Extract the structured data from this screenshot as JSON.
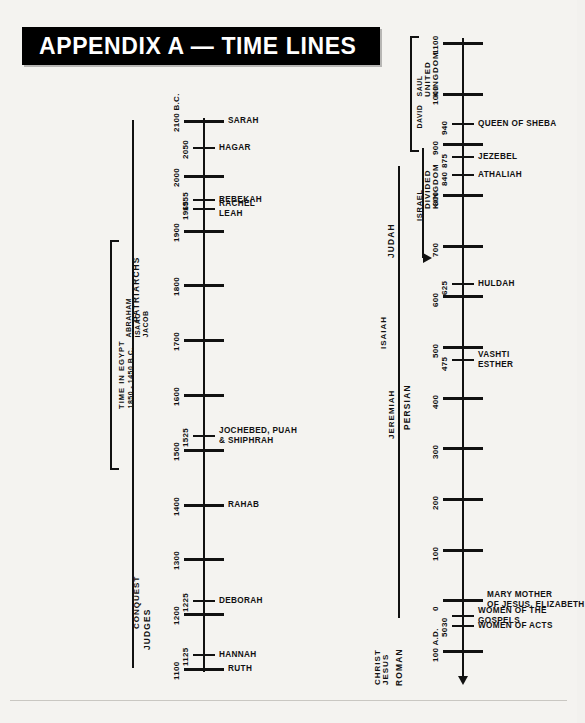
{
  "header": {
    "title": "APPENDIX A — TIME LINES"
  },
  "left_timeline": {
    "name": "old-testament-timeline",
    "range_top_label": "2100 B.C.",
    "range_bottom_label": "1100",
    "era_captions": [
      {
        "label": "PATRIARCHS",
        "sub": "ABRAHAM ISAAC JACOB"
      },
      {
        "label": "TIME IN EGYPT",
        "sub": "1850 - 1450 B.C."
      },
      {
        "label": "CONQUEST",
        "sub": ""
      },
      {
        "label": "JUDGES",
        "sub": ""
      }
    ],
    "ticks": [
      {
        "year": "2100 B.C.",
        "major": true,
        "events": [
          "SARAH"
        ]
      },
      {
        "year": "2050",
        "major": false,
        "events": [
          "HAGAR"
        ]
      },
      {
        "year": "2000",
        "major": true,
        "events": []
      },
      {
        "year": "1955",
        "major": false,
        "events": [
          "REBEKAH"
        ]
      },
      {
        "year": "1965",
        "major": false,
        "events": [
          "RACHEL",
          "LEAH"
        ]
      },
      {
        "year": "1900",
        "major": true,
        "events": []
      },
      {
        "year": "1800",
        "major": true,
        "events": []
      },
      {
        "year": "1700",
        "major": true,
        "events": []
      },
      {
        "year": "1600",
        "major": true,
        "events": []
      },
      {
        "year": "1525",
        "major": false,
        "events": [
          "JOCHEBED, PUAH",
          "& SHIPHRAH"
        ]
      },
      {
        "year": "1500",
        "major": true,
        "events": []
      },
      {
        "year": "1400",
        "major": true,
        "events": [
          "RAHAB"
        ]
      },
      {
        "year": "1300",
        "major": true,
        "events": []
      },
      {
        "year": "1225",
        "major": false,
        "events": [
          "DEBORAH"
        ]
      },
      {
        "year": "1200",
        "major": true,
        "events": []
      },
      {
        "year": "1125",
        "major": false,
        "events": [
          "HANNAH"
        ]
      },
      {
        "year": "1100",
        "major": true,
        "events": [
          "RUTH"
        ]
      }
    ]
  },
  "right_timeline": {
    "name": "kingdom-to-new-testament-timeline",
    "range_top_label": "1100",
    "range_bottom_label": "100 A.D.",
    "era_captions": [
      {
        "label": "UNITED KINGDOM",
        "sub": "SAUL DAVID"
      },
      {
        "label": "DIVIDED KINGDOM",
        "sub": "ISRAEL"
      },
      {
        "label": "JUDAH",
        "sub": ""
      },
      {
        "label": "ISAIAH",
        "sub": ""
      },
      {
        "label": "JEREMIAH",
        "sub": ""
      },
      {
        "label": "PERSIAN",
        "sub": ""
      },
      {
        "label": "ROMAN",
        "sub": ""
      },
      {
        "label": "JESUS CHRIST",
        "sub": ""
      }
    ],
    "ticks": [
      {
        "year": "1100",
        "major": true,
        "events": []
      },
      {
        "year": "1000",
        "major": true,
        "events": []
      },
      {
        "year": "940",
        "major": false,
        "events": [
          "QUEEN OF SHEBA"
        ]
      },
      {
        "year": "900",
        "major": true,
        "events": []
      },
      {
        "year": "875",
        "major": false,
        "events": [
          "JEZEBEL"
        ]
      },
      {
        "year": "840",
        "major": false,
        "events": [
          "ATHALIAH"
        ]
      },
      {
        "year": "800",
        "major": true,
        "events": []
      },
      {
        "year": "700",
        "major": true,
        "events": []
      },
      {
        "year": "625",
        "major": false,
        "events": [
          "HULDAH"
        ]
      },
      {
        "year": "600",
        "major": true,
        "events": []
      },
      {
        "year": "500",
        "major": true,
        "events": []
      },
      {
        "year": "475",
        "major": false,
        "events": [
          "VASHTI",
          "ESTHER"
        ]
      },
      {
        "year": "400",
        "major": true,
        "events": []
      },
      {
        "year": "300",
        "major": true,
        "events": []
      },
      {
        "year": "200",
        "major": true,
        "events": []
      },
      {
        "year": "100",
        "major": true,
        "events": []
      },
      {
        "year": "0",
        "major": true,
        "events": [
          "MARY MOTHER",
          "OF JESUS, ELIZABETH"
        ]
      },
      {
        "year": "30",
        "major": false,
        "events": [
          "WOMEN OF THE",
          "GOSPELS"
        ]
      },
      {
        "year": "50",
        "major": false,
        "events": [
          "WOMEN OF ACTS"
        ]
      },
      {
        "year": "100 A.D.",
        "major": true,
        "events": []
      }
    ]
  },
  "chart_data": {
    "type": "table",
    "title": "APPENDIX A — TIME LINES",
    "xlabel": "",
    "ylabel": "Years (B.C. → A.D.)",
    "series": [
      {
        "name": "Old Testament Era (left column)",
        "axis_range": [
          "2100 B.C.",
          "1100 B.C."
        ],
        "values": [
          {
            "year": "2100 B.C.",
            "label": "SARAH"
          },
          {
            "year": "2050",
            "label": "HAGAR"
          },
          {
            "year": "2000",
            "label": ""
          },
          {
            "year": "1955",
            "label": "REBEKAH"
          },
          {
            "year": "1965",
            "label": "RACHEL / LEAH"
          },
          {
            "year": "1900",
            "label": ""
          },
          {
            "year": "1800",
            "label": ""
          },
          {
            "year": "1700",
            "label": ""
          },
          {
            "year": "1600",
            "label": ""
          },
          {
            "year": "1525",
            "label": "JOCHEBED, PUAH & SHIPHRAH"
          },
          {
            "year": "1500",
            "label": ""
          },
          {
            "year": "1400",
            "label": "RAHAB"
          },
          {
            "year": "1300",
            "label": ""
          },
          {
            "year": "1225",
            "label": "DEBORAH"
          },
          {
            "year": "1200",
            "label": ""
          },
          {
            "year": "1125",
            "label": "HANNAH"
          },
          {
            "year": "1100",
            "label": "RUTH"
          }
        ],
        "eras": [
          "PATRIARCHS (ABRAHAM ISAAC JACOB)",
          "TIME IN EGYPT 1850-1450 B.C.",
          "CONQUEST",
          "JUDGES"
        ]
      },
      {
        "name": "Kingdom to New Testament Era (right column)",
        "axis_range": [
          "1100 B.C.",
          "100 A.D."
        ],
        "values": [
          {
            "year": "1100",
            "label": ""
          },
          {
            "year": "1000",
            "label": ""
          },
          {
            "year": "940",
            "label": "QUEEN OF SHEBA"
          },
          {
            "year": "900",
            "label": ""
          },
          {
            "year": "875",
            "label": "JEZEBEL"
          },
          {
            "year": "840",
            "label": "ATHALIAH"
          },
          {
            "year": "800",
            "label": ""
          },
          {
            "year": "700",
            "label": ""
          },
          {
            "year": "625",
            "label": "HULDAH"
          },
          {
            "year": "600",
            "label": ""
          },
          {
            "year": "500",
            "label": ""
          },
          {
            "year": "475",
            "label": "VASHTI / ESTHER"
          },
          {
            "year": "400",
            "label": ""
          },
          {
            "year": "300",
            "label": ""
          },
          {
            "year": "200",
            "label": ""
          },
          {
            "year": "100",
            "label": ""
          },
          {
            "year": "0",
            "label": "MARY MOTHER OF JESUS, ELIZABETH"
          },
          {
            "year": "30",
            "label": "WOMEN OF THE GOSPELS"
          },
          {
            "year": "50",
            "label": "WOMEN OF ACTS"
          },
          {
            "year": "100 A.D.",
            "label": ""
          }
        ],
        "eras": [
          "UNITED KINGDOM (SAUL DAVID)",
          "DIVIDED KINGDOM (ISRAEL)",
          "JUDAH",
          "ISAIAH",
          "JEREMIAH",
          "PERSIAN",
          "ROMAN",
          "JESUS CHRIST"
        ]
      }
    ]
  }
}
